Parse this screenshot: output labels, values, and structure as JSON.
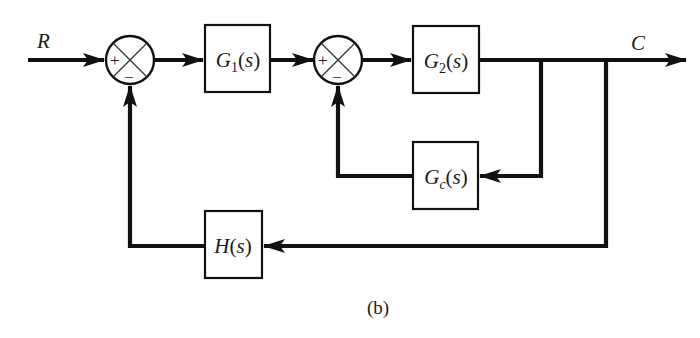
{
  "diagram": {
    "type": "block-diagram",
    "caption": "(b)",
    "input_signal": "R",
    "output_signal": "C",
    "blocks": [
      {
        "id": "G1",
        "name": "G",
        "sub": "1",
        "arg": "(s)"
      },
      {
        "id": "G2",
        "name": "G",
        "sub": "2",
        "arg": "(s)"
      },
      {
        "id": "Gc",
        "name": "G",
        "sub": "c",
        "arg": "(s)"
      },
      {
        "id": "H",
        "name": "H",
        "sub": "",
        "arg": "(s)"
      }
    ],
    "summing_junctions": [
      {
        "id": "sum1",
        "plus": "+",
        "minus": "−"
      },
      {
        "id": "sum2",
        "plus": "+",
        "minus": "−"
      }
    ],
    "connections": [
      "R -> sum1(+)",
      "sum1 -> G1",
      "G1 -> sum2(+)",
      "sum2 -> G2",
      "G2 -> C",
      "C -> Gc -> sum2(-)",
      "C -> H -> sum1(-)"
    ]
  }
}
